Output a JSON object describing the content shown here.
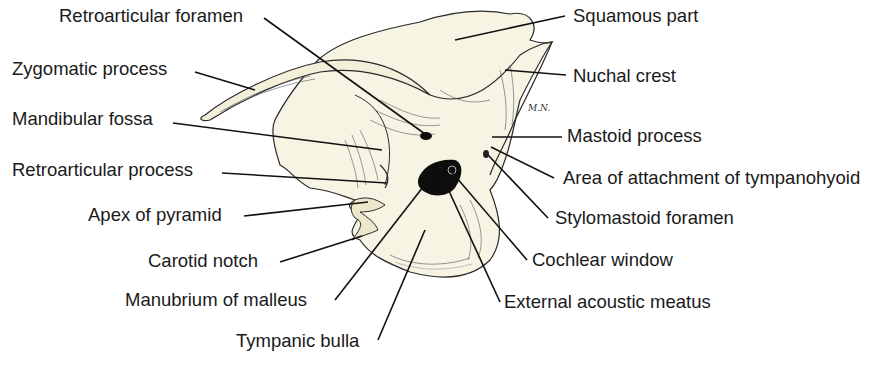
{
  "figure": {
    "artist_signature": "M.N.",
    "colors": {
      "bone_fill": "#f7f4e3",
      "bone_shade": "#ece6c8",
      "outline": "#2a2a2a",
      "cavity": "#0d0d0d",
      "leader_line": "#111111",
      "label_text": "#1a1a1a"
    },
    "labels_left": [
      {
        "id": "retroarticular-foramen",
        "text": "Retroarticular foramen"
      },
      {
        "id": "zygomatic-process",
        "text": "Zygomatic process"
      },
      {
        "id": "mandibular-fossa",
        "text": "Mandibular fossa"
      },
      {
        "id": "retroarticular-process",
        "text": "Retroarticular process"
      },
      {
        "id": "apex-of-pyramid",
        "text": "Apex of pyramid"
      },
      {
        "id": "carotid-notch",
        "text": "Carotid notch"
      },
      {
        "id": "manubrium-of-malleus",
        "text": "Manubrium of malleus"
      },
      {
        "id": "tympanic-bulla",
        "text": "Tympanic bulla"
      }
    ],
    "labels_right": [
      {
        "id": "squamous-part",
        "text": "Squamous part"
      },
      {
        "id": "nuchal-crest",
        "text": "Nuchal crest"
      },
      {
        "id": "mastoid-process",
        "text": "Mastoid process"
      },
      {
        "id": "area-of-attachment-of-tympanohyoid",
        "text": "Area of attachment of tympanohyoid"
      },
      {
        "id": "stylomastoid-foramen",
        "text": "Stylomastoid foramen"
      },
      {
        "id": "cochlear-window",
        "text": "Cochlear window"
      },
      {
        "id": "external-acoustic-meatus",
        "text": "External acoustic meatus"
      }
    ]
  }
}
